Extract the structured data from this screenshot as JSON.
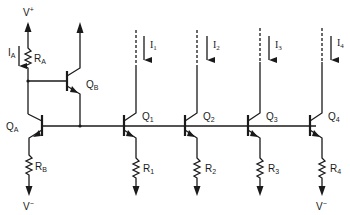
{
  "diagram": {
    "title": "",
    "type": "current-mirror-circuit",
    "supply": {
      "positive": "V",
      "positive_sup": "+",
      "negative": "V",
      "negative_sup": "−"
    },
    "reference": {
      "current": {
        "main": "I",
        "sub": "A"
      },
      "resistor_top": {
        "main": "R",
        "sub": "A"
      },
      "resistor_bottom": {
        "main": "R",
        "sub": "B"
      },
      "transistor_main": {
        "main": "Q",
        "sub": "A"
      },
      "transistor_buffer": {
        "main": "Q",
        "sub": "B"
      }
    },
    "outputs": [
      {
        "transistor": {
          "main": "Q",
          "sub": "1"
        },
        "resistor": {
          "main": "R",
          "sub": "1"
        },
        "current": {
          "main": "I",
          "sub": "1"
        }
      },
      {
        "transistor": {
          "main": "Q",
          "sub": "2"
        },
        "resistor": {
          "main": "R",
          "sub": "2"
        },
        "current": {
          "main": "I",
          "sub": "2"
        }
      },
      {
        "transistor": {
          "main": "Q",
          "sub": "3"
        },
        "resistor": {
          "main": "R",
          "sub": "3"
        },
        "current": {
          "main": "I",
          "sub": "3"
        }
      },
      {
        "transistor": {
          "main": "Q",
          "sub": "4"
        },
        "resistor": {
          "main": "R",
          "sub": "4"
        },
        "current": {
          "main": "I",
          "sub": "4"
        }
      }
    ]
  }
}
